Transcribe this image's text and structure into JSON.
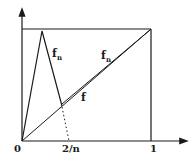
{
  "diagram": {
    "labels": {
      "origin": "0",
      "two_over_n": "2/n",
      "one": "1",
      "fn_left": "f",
      "fn_left_sub": "n",
      "fn_right": "f",
      "fn_right_sub": "n",
      "f": "f"
    },
    "colors": {
      "line": "#1a1a1a",
      "background": "#ffffff"
    }
  }
}
